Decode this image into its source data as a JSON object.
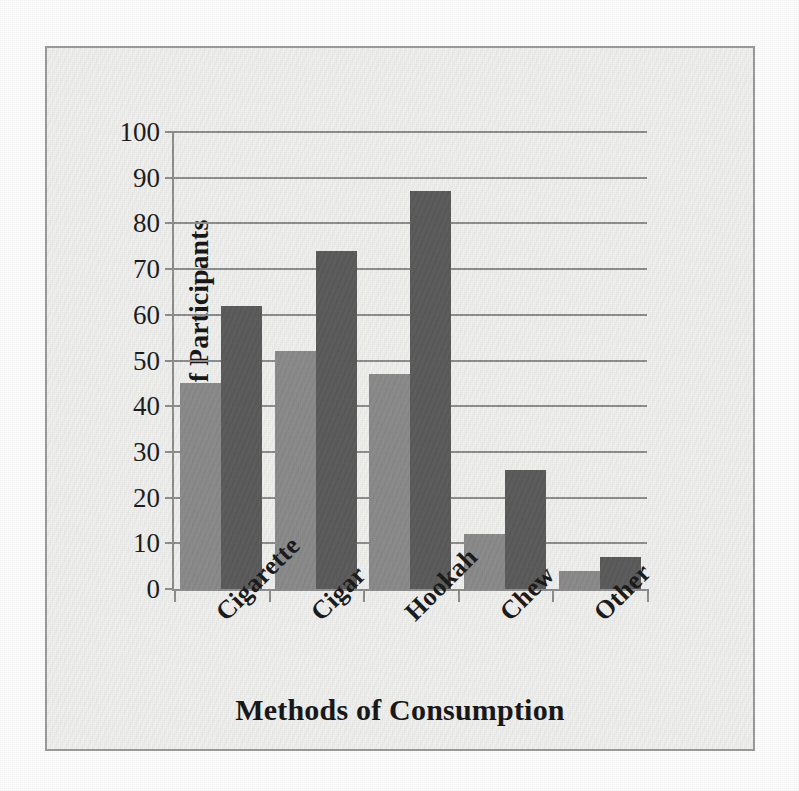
{
  "chart_data": {
    "type": "bar",
    "title": "",
    "subtitle": "",
    "xlabel": "Methods of Consumption",
    "ylabel": "Number of Participants",
    "categories": [
      "Cigarette",
      "Cigar",
      "Hookah",
      "Chew",
      "Other"
    ],
    "series": [
      {
        "name": "Series 1",
        "color": "#8b8b8b",
        "values": [
          45,
          52,
          47,
          12,
          4
        ]
      },
      {
        "name": "Series 2",
        "color": "#5b5b5b",
        "values": [
          62,
          74,
          87,
          26,
          7
        ]
      }
    ],
    "ylim": [
      0,
      100
    ],
    "yticks": [
      0,
      10,
      20,
      30,
      40,
      50,
      60,
      70,
      80,
      90,
      100
    ],
    "ytick_labels": [
      "0",
      "10",
      "20",
      "30",
      "40",
      "50",
      "60",
      "70",
      "80",
      "90",
      "100"
    ],
    "grid": "horizontal",
    "legend": "none",
    "xtick_label_rotation": -45,
    "colors": {
      "plot_background": "#f0f0ef",
      "frame_border": "#9b9b9b",
      "gridline": "#8e8e8e",
      "axis_line": "#8e8e8e",
      "text": "#1a1a1a"
    }
  }
}
